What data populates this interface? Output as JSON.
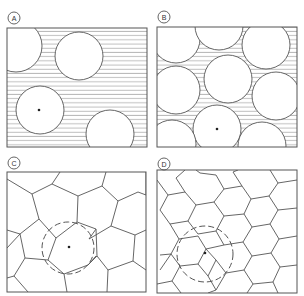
{
  "figure": {
    "panels": [
      {
        "id": "A",
        "label": "A",
        "description": "Sparse circles on horizontally hatched background",
        "circle_count": 4,
        "marked_center": true
      },
      {
        "id": "B",
        "label": "B",
        "description": "Densely packed circles with hatched interstices",
        "circle_count": 10,
        "marked_center": true
      },
      {
        "id": "C",
        "label": "C",
        "description": "Large hexagonal tessellation with dashed circle around central cell",
        "marked_center": true
      },
      {
        "id": "D",
        "label": "D",
        "description": "Smaller hexagonal tessellation with dashed circle spanning several cells",
        "marked_center": true
      }
    ],
    "colors": {
      "line": "#555555",
      "hatch": "#8a8a8a",
      "background": "#ffffff"
    }
  }
}
